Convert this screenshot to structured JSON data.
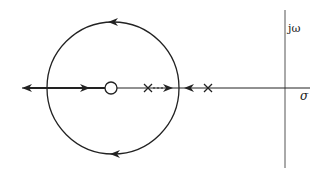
{
  "diagram": {
    "type": "root-locus",
    "colors": {
      "stroke": "#222222",
      "background": "#ffffff"
    },
    "axes": {
      "imaginary_label": "jω",
      "real_label": "σ"
    },
    "zeros": [
      {
        "position": "left of poles, center of circle"
      }
    ],
    "poles": [
      {
        "position": "inside circle, right of zero"
      },
      {
        "position": "outside circle, right"
      }
    ],
    "locus": {
      "circle": "counter-clockwise locus around zero",
      "breakaway": "right edge of circle on real axis",
      "break_in": "left edge of circle on real axis",
      "asymptote": "real axis toward -∞"
    }
  }
}
